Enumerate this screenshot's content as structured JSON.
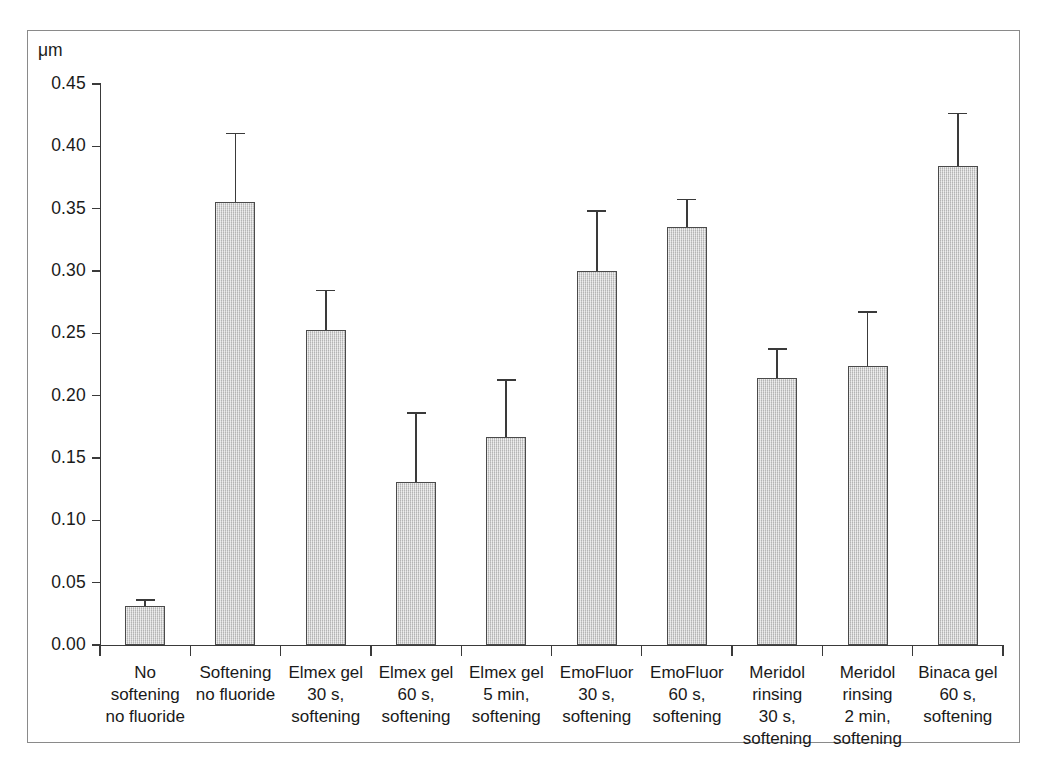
{
  "figure": {
    "background_color": "#ffffff",
    "frame_color": "#8a8a8a"
  },
  "axis": {
    "unit_label": "μm",
    "y_tick_labels": [
      "0.45",
      "0.40",
      "0.35",
      "0.30",
      "0.25",
      "0.20",
      "0.15",
      "0.10",
      "0.05",
      "0.00"
    ]
  },
  "style": {
    "bar_fill": "#c9c9c9",
    "bar_edge": "#4a4a4a",
    "axis_color": "#3a3a3a",
    "text_color": "#1a1a1a"
  },
  "chart_data": {
    "type": "bar",
    "title": "",
    "xlabel": "",
    "ylabel": "μm",
    "ylim": [
      0.0,
      0.45
    ],
    "ytick_step": 0.05,
    "grid": false,
    "legend": null,
    "error_bar_type": "upper-only",
    "categories": [
      "No softening no fluoride",
      "Softening no fluoride",
      "Elmex gel 30 s, softening",
      "Elmex gel 60 s, softening",
      "Elmex gel 5 min, softening",
      "EmoFluor 30 s, softening",
      "EmoFluor 60 s, softening",
      "Meridol rinsing 30 s, softening",
      "Meridol rinsing 2 min, softening",
      "Binaca gel 60 s, softening"
    ],
    "category_lines": [
      [
        "No",
        "softening",
        "no fluoride"
      ],
      [
        "Softening",
        "no fluoride"
      ],
      [
        "Elmex gel",
        "30 s,",
        "softening"
      ],
      [
        "Elmex gel",
        "60 s,",
        "softening"
      ],
      [
        "Elmex gel",
        "5 min,",
        "softening"
      ],
      [
        "EmoFluor",
        "30 s,",
        "softening"
      ],
      [
        "EmoFluor",
        "60 s,",
        "softening"
      ],
      [
        "Meridol",
        "rinsing",
        "30 s,",
        "softening"
      ],
      [
        "Meridol",
        "rinsing",
        "2 min,",
        "softening"
      ],
      [
        "Binaca gel",
        "60 s,",
        "softening"
      ]
    ],
    "values": [
      0.031,
      0.355,
      0.253,
      0.131,
      0.167,
      0.3,
      0.335,
      0.214,
      0.224,
      0.384
    ],
    "error_upper": [
      0.037,
      0.411,
      0.285,
      0.187,
      0.213,
      0.349,
      0.358,
      0.238,
      0.268,
      0.427
    ],
    "error_magnitude": [
      0.006,
      0.056,
      0.032,
      0.056,
      0.046,
      0.049,
      0.023,
      0.024,
      0.044,
      0.043
    ]
  }
}
